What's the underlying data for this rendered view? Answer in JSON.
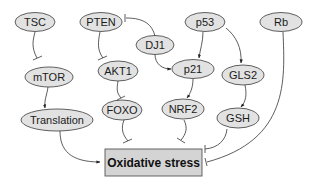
{
  "diagram": {
    "colors": {
      "node_fill": "#e2e2e2",
      "node_stroke": "#3a3a3a",
      "box_fill": "#d4d4d4",
      "box_stroke": "#555555",
      "edge": "#333333"
    },
    "nodes": {
      "tsc": "TSC",
      "pten": "PTEN",
      "p53": "p53",
      "rb": "Rb",
      "dj1": "DJ1",
      "mtor": "mTOR",
      "akt1": "AKT1",
      "p21": "p21",
      "gls2": "GLS2",
      "translation": "Translation",
      "foxo": "FOXO",
      "nrf2": "NRF2",
      "gsh": "GSH"
    },
    "target": "Oxidative stress",
    "edges": [
      {
        "from": "TSC",
        "to": "mTOR",
        "type": "inhibition"
      },
      {
        "from": "mTOR",
        "to": "Translation",
        "type": "activation"
      },
      {
        "from": "Translation",
        "to": "Oxidative stress",
        "type": "activation"
      },
      {
        "from": "PTEN",
        "to": "AKT1",
        "type": "inhibition"
      },
      {
        "from": "DJ1",
        "to": "PTEN",
        "type": "inhibition"
      },
      {
        "from": "DJ1",
        "to": "p21",
        "type": "activation"
      },
      {
        "from": "AKT1",
        "to": "FOXO",
        "type": "inhibition"
      },
      {
        "from": "FOXO",
        "to": "Oxidative stress",
        "type": "inhibition"
      },
      {
        "from": "p53",
        "to": "p21",
        "type": "activation"
      },
      {
        "from": "p53",
        "to": "GLS2",
        "type": "activation"
      },
      {
        "from": "p21",
        "to": "NRF2",
        "type": "activation"
      },
      {
        "from": "NRF2",
        "to": "Oxidative stress",
        "type": "inhibition"
      },
      {
        "from": "GLS2",
        "to": "GSH",
        "type": "activation"
      },
      {
        "from": "GSH",
        "to": "Oxidative stress",
        "type": "inhibition"
      },
      {
        "from": "Rb",
        "to": "Oxidative stress",
        "type": "inhibition"
      }
    ]
  }
}
